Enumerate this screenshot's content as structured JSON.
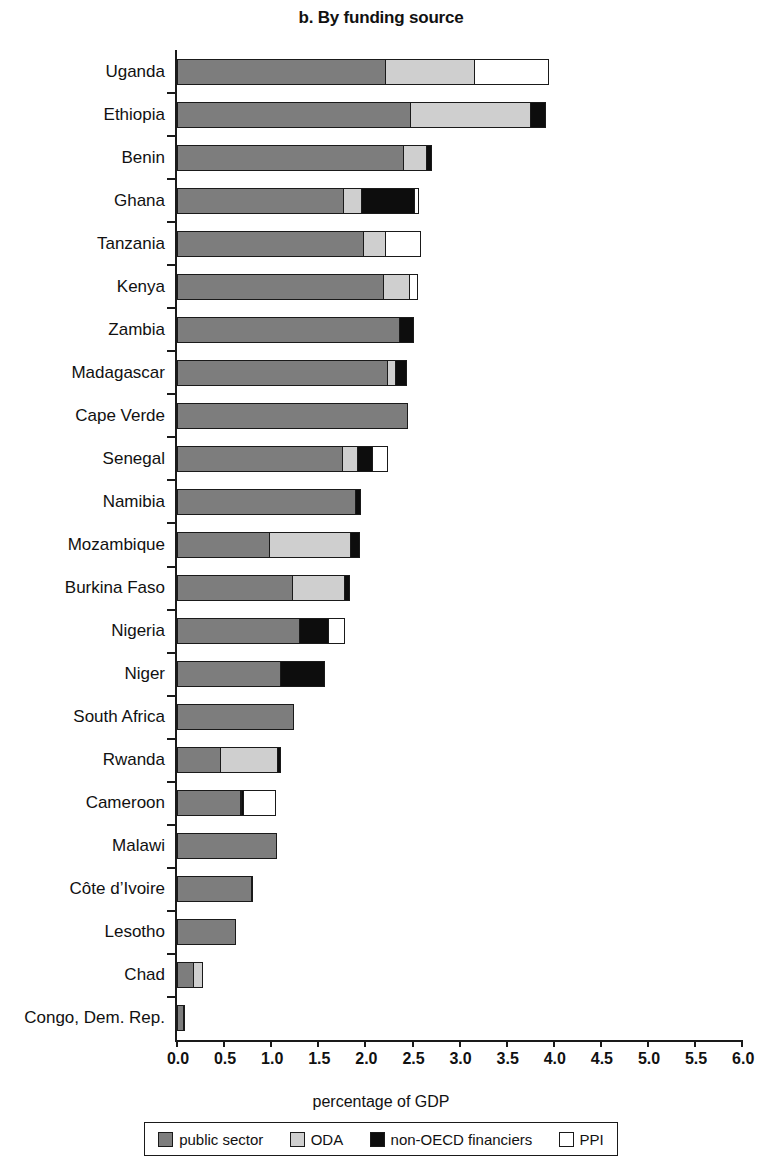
{
  "chart_data": {
    "type": "bar",
    "title": "b. By funding source",
    "xlabel": "percentage of GDP",
    "ylabel": "",
    "orientation": "horizontal",
    "stacked": true,
    "grid": false,
    "xlim": [
      0.0,
      6.0
    ],
    "xticks": [
      "0.0",
      "0.5",
      "1.0",
      "1.5",
      "2.0",
      "2.5",
      "3.0",
      "3.5",
      "4.0",
      "4.5",
      "5.0",
      "5.5",
      "6.0"
    ],
    "legend_position": "bottom",
    "categories": [
      "Uganda",
      "Ethiopia",
      "Benin",
      "Ghana",
      "Tanzania",
      "Kenya",
      "Zambia",
      "Madagascar",
      "Cape Verde",
      "Senegal",
      "Namibia",
      "Mozambique",
      "Burkina Faso",
      "Nigeria",
      "Niger",
      "South Africa",
      "Rwanda",
      "Cameroon",
      "Malawi",
      "Côte d’Ivoire",
      "Lesotho",
      "Chad",
      "Congo, Dem. Rep."
    ],
    "series": [
      {
        "name": "public sector",
        "color": "#7d7d7d",
        "values": [
          2.22,
          2.49,
          2.42,
          1.78,
          1.99,
          2.2,
          2.37,
          2.25,
          2.45,
          1.77,
          1.91,
          0.99,
          1.24,
          1.31,
          1.11,
          1.24,
          0.47,
          0.69,
          1.06,
          0.8,
          0.63,
          0.19,
          0.08
        ]
      },
      {
        "name": "ODA",
        "color": "#cfcfcf",
        "values": [
          0.97,
          1.29,
          0.26,
          0.2,
          0.25,
          0.3,
          0.0,
          0.1,
          0.0,
          0.17,
          0.0,
          0.88,
          0.57,
          0.0,
          0.0,
          0.0,
          0.62,
          0.02,
          0.0,
          0.02,
          0.0,
          0.1,
          0.02
        ]
      },
      {
        "name": "non-OECD financiers",
        "color": "#0d0d0d",
        "values": [
          0.0,
          0.17,
          0.06,
          0.58,
          0.0,
          0.0,
          0.16,
          0.12,
          0.0,
          0.18,
          0.06,
          0.1,
          0.06,
          0.32,
          0.48,
          0.0,
          0.05,
          0.04,
          0.0,
          0.0,
          0.0,
          0.0,
          0.0
        ]
      },
      {
        "name": "PPI",
        "color": "#ffffff",
        "values": [
          0.79,
          0.0,
          0.0,
          0.06,
          0.38,
          0.09,
          0.0,
          0.0,
          0.0,
          0.17,
          0.0,
          0.0,
          0.0,
          0.19,
          0.0,
          0.0,
          0.0,
          0.35,
          0.0,
          0.0,
          0.0,
          0.0,
          0.0
        ]
      }
    ],
    "totals": [
      3.98,
      3.95,
      2.74,
      2.62,
      2.62,
      2.59,
      2.53,
      2.47,
      2.45,
      2.29,
      1.97,
      1.97,
      1.87,
      1.82,
      1.59,
      1.24,
      1.14,
      1.1,
      1.06,
      0.82,
      0.63,
      0.29,
      0.1
    ]
  },
  "legend": {
    "items": [
      {
        "label": "public sector",
        "swatch": "public"
      },
      {
        "label": "ODA",
        "swatch": "oda"
      },
      {
        "label": "non-OECD financiers",
        "swatch": "nonoecd"
      },
      {
        "label": "PPI",
        "swatch": "ppi"
      }
    ]
  }
}
